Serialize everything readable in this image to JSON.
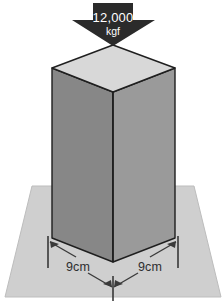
{
  "figure": {
    "background_color": "#ffffff"
  },
  "load_arrow": {
    "icon": "down-arrow-icon",
    "value": "12,000",
    "unit": "kgf",
    "color": "#2b2b2b",
    "text_color": "#ffffff",
    "direction": "down"
  },
  "column": {
    "shape": "square-prism",
    "top_face_color": "#d8d8d8",
    "left_face_color": "#878787",
    "right_face_color": "#9a9a9a",
    "outline_color": "#1f1f1f"
  },
  "ground": {
    "shape": "trapezoid-plane",
    "color": "#cfcfcf",
    "outline_color": "#b4b4b4"
  },
  "dimensions": [
    {
      "id": "width-left",
      "label": "9cm",
      "side": "left"
    },
    {
      "id": "width-right",
      "label": "9cm",
      "side": "right"
    }
  ],
  "dimension_style": {
    "line_color": "#3a3a3a",
    "tick_color": "#2e2e2e"
  }
}
